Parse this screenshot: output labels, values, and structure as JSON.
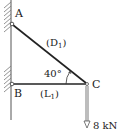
{
  "diagram": {
    "type": "truss-bracket",
    "points": {
      "A": {
        "label": "A"
      },
      "B": {
        "label": "B"
      },
      "C": {
        "label": "C"
      }
    },
    "members": [
      {
        "id": "D1",
        "label_main": "(D",
        "label_sub": "1",
        "label_close": ")",
        "from": "A",
        "to": "C"
      },
      {
        "id": "L1",
        "label_main": "(L",
        "label_sub": "1",
        "label_close": ")",
        "from": "B",
        "to": "C"
      }
    ],
    "angle": {
      "value": "40°",
      "between": [
        "D1",
        "L1"
      ],
      "at": "C"
    },
    "load": {
      "value": "8 kN",
      "at": "C",
      "direction": "down"
    },
    "colors": {
      "line": "#222222",
      "wall": "#555555",
      "hatch": "#777777"
    }
  }
}
